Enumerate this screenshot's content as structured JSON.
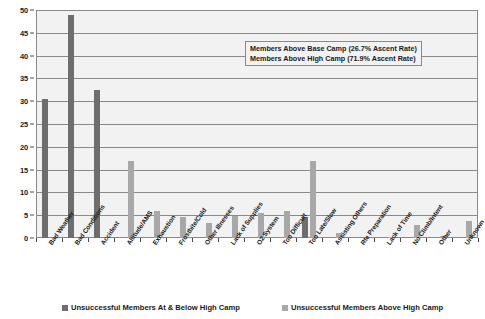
{
  "chart_data": {
    "type": "bar",
    "title": "",
    "xlabel": "",
    "ylabel": "",
    "ylim": [
      0,
      50
    ],
    "ytick_step": 5,
    "yticks": [
      "0",
      "5",
      "10",
      "15",
      "20",
      "25",
      "30",
      "35",
      "40",
      "45",
      "50"
    ],
    "grid": true,
    "legend_position": "bottom",
    "categories": [
      "Bad Weather",
      "Bad Conditions",
      "Accident",
      "Altitude/AMS",
      "Exhaustion",
      "Frostbite/Cold",
      "Other Illnesses",
      "Lack of Supplies",
      "O2 System",
      "Too Difficult",
      "Too Late/Slow",
      "Assisting Others",
      "Rte Preparation",
      "Lack of Time",
      "No Climb/Intent",
      "Other",
      "Unknown"
    ],
    "series": [
      {
        "name": "Unsuccessful Members At & Below High Camp",
        "color": "#6e6e6e",
        "values": [
          30.5,
          48.8,
          32.5,
          0,
          0,
          0,
          0,
          0,
          0,
          0,
          4.7,
          0,
          0,
          0,
          0,
          0,
          0
        ]
      },
      {
        "name": "Unsuccessful Members Above High Camp",
        "color": "#a8a8a8",
        "values": [
          0,
          0,
          0,
          16.9,
          5.9,
          4.6,
          3.3,
          4.9,
          5.4,
          5.9,
          16.9,
          1.1,
          0,
          0.3,
          2.9,
          0.4,
          3.7
        ]
      }
    ],
    "annotations": [
      "Members Above Base Camp (26.7% Ascent Rate)",
      "Members Above High Camp (71.9% Ascent Rate)"
    ]
  },
  "legend": {
    "items": [
      {
        "label": "Unsuccessful Members At & Below High Camp"
      },
      {
        "label": "Unsuccessful Members Above High Camp"
      }
    ]
  }
}
